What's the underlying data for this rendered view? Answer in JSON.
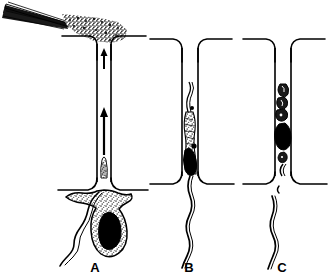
{
  "figure": {
    "background_color": "#ffffff",
    "ink_color": "#000000",
    "stipple_color": "#8a8a8a",
    "width": 330,
    "height": 277
  },
  "panels": [
    {
      "id": "A",
      "label": "A",
      "label_x": 95,
      "label_y": 271,
      "channel": {
        "center_x": 104,
        "top_y": 36,
        "bottom_y": 190,
        "inner_half_width": 7,
        "flare": 13
      },
      "features": [
        "micropipette",
        "injected-stipple-plume",
        "flow-arrow-upper",
        "flow-arrow-lower",
        "cell-body-stippled",
        "nucleus-solid-black",
        "flagellum"
      ],
      "arrows": [
        {
          "name": "flow-arrow-upper",
          "x": 104,
          "y_tail": 68,
          "y_head": 50,
          "direction": "up"
        },
        {
          "name": "flow-arrow-lower",
          "x": 104,
          "y_tail": 155,
          "y_head": 108,
          "direction": "up"
        }
      ]
    },
    {
      "id": "B",
      "label": "B",
      "label_x": 188,
      "label_y": 271,
      "channel": {
        "center_x": 190,
        "top_y": 39,
        "bottom_y": 184,
        "inner_half_width": 8,
        "flare": 13
      },
      "features": [
        "cell-elongated-in-channel",
        "nucleus-solid-black",
        "flagellum-trailing-below"
      ],
      "arrows": []
    },
    {
      "id": "C",
      "label": "C",
      "label_x": 281,
      "label_y": 271,
      "channel": {
        "center_x": 283,
        "top_y": 39,
        "bottom_y": 184,
        "inner_half_width": 8,
        "flare": 13
      },
      "features": [
        "cell-fragmented-in-channel",
        "nucleus-solid-black",
        "flagellum-detached-below"
      ],
      "arrows": []
    }
  ],
  "annotations": {
    "pipette_name": "micropipette",
    "plume_name": "injected-suspension-plume"
  }
}
